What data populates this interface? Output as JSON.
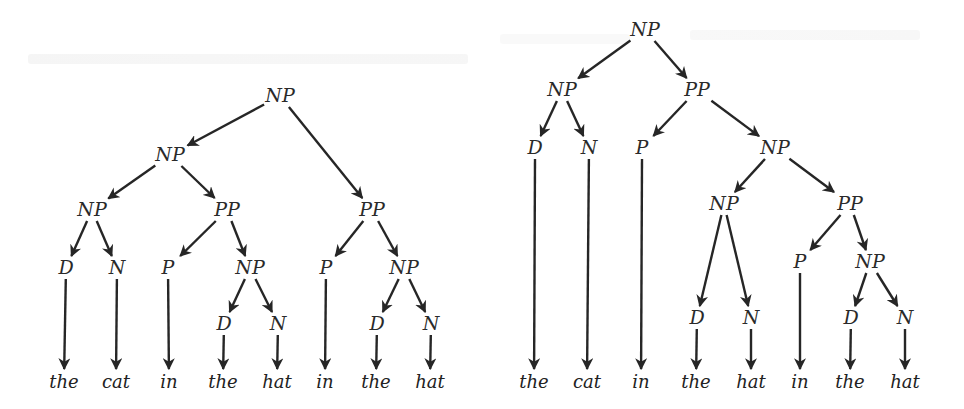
{
  "figure": {
    "colors": {
      "ink": "#262626",
      "background": "#ffffff"
    }
  },
  "trees": [
    {
      "id": "left-tree",
      "sentence": [
        "the",
        "cat",
        "in",
        "the",
        "hat",
        "in",
        "the",
        "hat"
      ],
      "nodes": [
        {
          "id": "n0",
          "label": "NP",
          "x": 280,
          "y": 96
        },
        {
          "id": "n1",
          "label": "NP",
          "x": 170,
          "y": 155
        },
        {
          "id": "n2",
          "label": "PP",
          "x": 372,
          "y": 210
        },
        {
          "id": "n3",
          "label": "NP",
          "x": 92,
          "y": 210
        },
        {
          "id": "n4",
          "label": "PP",
          "x": 227,
          "y": 210
        },
        {
          "id": "n5",
          "label": "D",
          "x": 66,
          "y": 268
        },
        {
          "id": "n6",
          "label": "N",
          "x": 117,
          "y": 268
        },
        {
          "id": "n7",
          "label": "P",
          "x": 168,
          "y": 268
        },
        {
          "id": "n8",
          "label": "NP",
          "x": 250,
          "y": 268
        },
        {
          "id": "n9",
          "label": "P",
          "x": 326,
          "y": 268
        },
        {
          "id": "n10",
          "label": "NP",
          "x": 404,
          "y": 268
        },
        {
          "id": "n11",
          "label": "D",
          "x": 224,
          "y": 324
        },
        {
          "id": "n12",
          "label": "N",
          "x": 278,
          "y": 324
        },
        {
          "id": "n13",
          "label": "D",
          "x": 377,
          "y": 324
        },
        {
          "id": "n14",
          "label": "N",
          "x": 431,
          "y": 324
        }
      ],
      "leaves": [
        {
          "id": "w0",
          "label": "the",
          "x": 64,
          "y": 382
        },
        {
          "id": "w1",
          "label": "cat",
          "x": 116,
          "y": 382
        },
        {
          "id": "w2",
          "label": "in",
          "x": 169,
          "y": 382
        },
        {
          "id": "w3",
          "label": "the",
          "x": 223,
          "y": 382
        },
        {
          "id": "w4",
          "label": "hat",
          "x": 277,
          "y": 382
        },
        {
          "id": "w5",
          "label": "in",
          "x": 325,
          "y": 382
        },
        {
          "id": "w6",
          "label": "the",
          "x": 376,
          "y": 382
        },
        {
          "id": "w7",
          "label": "hat",
          "x": 430,
          "y": 382
        }
      ],
      "edges": [
        [
          "n0",
          "n1"
        ],
        [
          "n0",
          "n2"
        ],
        [
          "n1",
          "n3"
        ],
        [
          "n1",
          "n4"
        ],
        [
          "n3",
          "n5"
        ],
        [
          "n3",
          "n6"
        ],
        [
          "n4",
          "n7"
        ],
        [
          "n4",
          "n8"
        ],
        [
          "n2",
          "n9"
        ],
        [
          "n2",
          "n10"
        ],
        [
          "n8",
          "n11"
        ],
        [
          "n8",
          "n12"
        ],
        [
          "n10",
          "n13"
        ],
        [
          "n10",
          "n14"
        ],
        [
          "n5",
          "w0"
        ],
        [
          "n6",
          "w1"
        ],
        [
          "n7",
          "w2"
        ],
        [
          "n11",
          "w3"
        ],
        [
          "n12",
          "w4"
        ],
        [
          "n9",
          "w5"
        ],
        [
          "n13",
          "w6"
        ],
        [
          "n14",
          "w7"
        ]
      ]
    },
    {
      "id": "right-tree",
      "sentence": [
        "the",
        "cat",
        "in",
        "the",
        "hat",
        "in",
        "the",
        "hat"
      ],
      "nodes": [
        {
          "id": "m0",
          "label": "NP",
          "x": 645,
          "y": 30
        },
        {
          "id": "m1",
          "label": "NP",
          "x": 562,
          "y": 90
        },
        {
          "id": "m2",
          "label": "PP",
          "x": 697,
          "y": 90
        },
        {
          "id": "m3",
          "label": "D",
          "x": 535,
          "y": 148
        },
        {
          "id": "m4",
          "label": "N",
          "x": 589,
          "y": 148
        },
        {
          "id": "m5",
          "label": "P",
          "x": 642,
          "y": 148
        },
        {
          "id": "m6",
          "label": "NP",
          "x": 775,
          "y": 148
        },
        {
          "id": "m7",
          "label": "NP",
          "x": 724,
          "y": 204
        },
        {
          "id": "m8",
          "label": "PP",
          "x": 850,
          "y": 204
        },
        {
          "id": "m9",
          "label": "P",
          "x": 800,
          "y": 262
        },
        {
          "id": "m10",
          "label": "NP",
          "x": 870,
          "y": 262
        },
        {
          "id": "m11",
          "label": "D",
          "x": 697,
          "y": 318
        },
        {
          "id": "m12",
          "label": "N",
          "x": 751,
          "y": 318
        },
        {
          "id": "m13",
          "label": "D",
          "x": 851,
          "y": 318
        },
        {
          "id": "m14",
          "label": "N",
          "x": 905,
          "y": 318
        }
      ],
      "leaves": [
        {
          "id": "v0",
          "label": "the",
          "x": 534,
          "y": 382
        },
        {
          "id": "v1",
          "label": "cat",
          "x": 587,
          "y": 382
        },
        {
          "id": "v2",
          "label": "in",
          "x": 641,
          "y": 382
        },
        {
          "id": "v3",
          "label": "the",
          "x": 696,
          "y": 382
        },
        {
          "id": "v4",
          "label": "hat",
          "x": 751,
          "y": 382
        },
        {
          "id": "v5",
          "label": "in",
          "x": 800,
          "y": 382
        },
        {
          "id": "v6",
          "label": "the",
          "x": 850,
          "y": 382
        },
        {
          "id": "v7",
          "label": "hat",
          "x": 905,
          "y": 382
        }
      ],
      "edges": [
        [
          "m0",
          "m1"
        ],
        [
          "m0",
          "m2"
        ],
        [
          "m1",
          "m3"
        ],
        [
          "m1",
          "m4"
        ],
        [
          "m2",
          "m5"
        ],
        [
          "m2",
          "m6"
        ],
        [
          "m6",
          "m7"
        ],
        [
          "m6",
          "m8"
        ],
        [
          "m7",
          "m11"
        ],
        [
          "m7",
          "m12"
        ],
        [
          "m8",
          "m9"
        ],
        [
          "m8",
          "m10"
        ],
        [
          "m10",
          "m13"
        ],
        [
          "m10",
          "m14"
        ],
        [
          "m3",
          "v0"
        ],
        [
          "m4",
          "v1"
        ],
        [
          "m5",
          "v2"
        ],
        [
          "m11",
          "v3"
        ],
        [
          "m12",
          "v4"
        ],
        [
          "m9",
          "v5"
        ],
        [
          "m13",
          "v6"
        ],
        [
          "m14",
          "v7"
        ]
      ]
    }
  ]
}
